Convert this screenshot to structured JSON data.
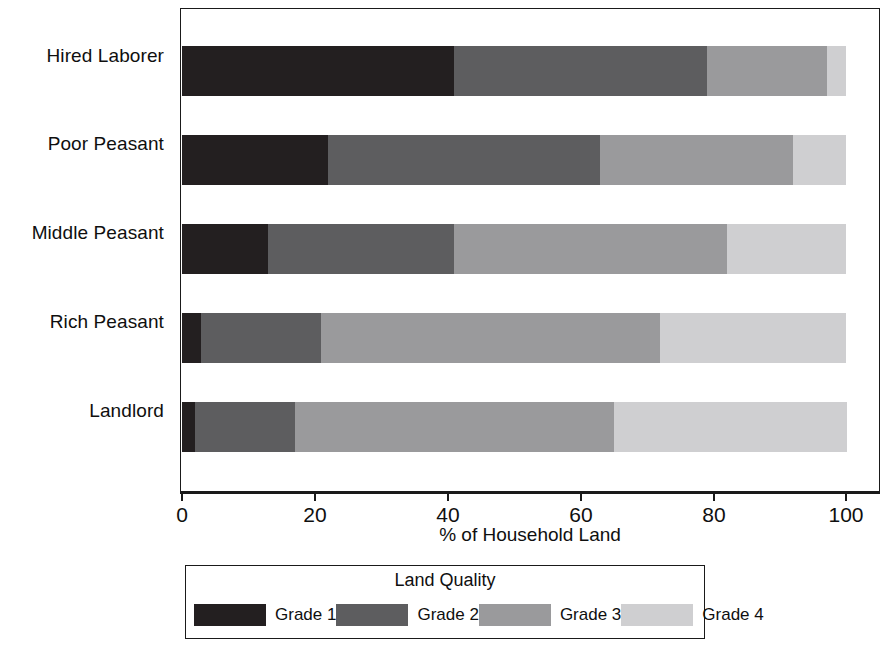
{
  "chart_data": {
    "type": "bar",
    "orientation": "horizontal",
    "stacked": true,
    "stack_total": 100,
    "title": "",
    "xlabel": "% of Household Land",
    "ylabel": "",
    "xlim": [
      0,
      100
    ],
    "xticks": [
      0,
      20,
      40,
      60,
      80,
      100
    ],
    "xticklabels": [
      "0",
      "20",
      "40",
      "60",
      "80",
      "100"
    ],
    "grid": false,
    "legend_title": "Land Quality",
    "legend_position": "bottom",
    "categories": [
      "Hired Laborer",
      "Poor Peasant",
      "Middle Peasant",
      "Rich Peasant",
      "Landlord"
    ],
    "series": [
      {
        "name": "Grade 1",
        "color": "#231f20",
        "values": [
          41,
          22,
          13,
          3,
          2
        ]
      },
      {
        "name": "Grade 2",
        "color": "#5d5d5f",
        "values": [
          38,
          41,
          28,
          18,
          15
        ]
      },
      {
        "name": "Grade 3",
        "color": "#9a9a9c",
        "values": [
          18,
          29,
          41,
          51,
          48
        ]
      },
      {
        "name": "Grade 4",
        "color": "#cfcfd1",
        "values": [
          3,
          8,
          18,
          28,
          35
        ]
      }
    ],
    "cumulative_boundaries": {
      "Hired Laborer": [
        41,
        79,
        97,
        100
      ],
      "Poor Peasant": [
        22,
        63,
        92,
        100
      ],
      "Middle Peasant": [
        13,
        41,
        82,
        100
      ],
      "Rich Peasant": [
        3,
        21,
        72,
        100
      ],
      "Landlord": [
        2,
        17,
        65,
        100
      ]
    }
  },
  "axis": {
    "x_title": "% of Household Land",
    "tick_labels": [
      "0",
      "20",
      "40",
      "60",
      "80",
      "100"
    ]
  },
  "legend": {
    "title": "Land Quality",
    "entries": [
      {
        "label": "Grade 1",
        "color": "#231f20"
      },
      {
        "label": "Grade 2",
        "color": "#5d5d5f"
      },
      {
        "label": "Grade 3",
        "color": "#9a9a9c"
      },
      {
        "label": "Grade 4",
        "color": "#cfcfd1"
      }
    ]
  }
}
